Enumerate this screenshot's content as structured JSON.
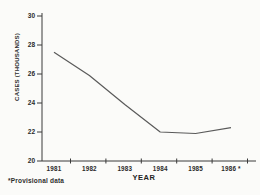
{
  "chart_data": {
    "type": "line",
    "title": "",
    "xlabel": "YEAR",
    "ylabel": "CASES (THOUSANDS)",
    "categories": [
      "1981",
      "1982",
      "1983",
      "1984",
      "1985",
      "1986 *"
    ],
    "values": [
      27.5,
      25.9,
      23.9,
      22.0,
      21.9,
      22.3
    ],
    "y_ticks": [
      20,
      22,
      24,
      26,
      28,
      30
    ],
    "ylim": [
      20,
      30
    ],
    "grid": false,
    "legend": "none",
    "line_color": "#5a5a5a",
    "axis_color": "#3a3a3a"
  },
  "footnote": "*Provisional data"
}
